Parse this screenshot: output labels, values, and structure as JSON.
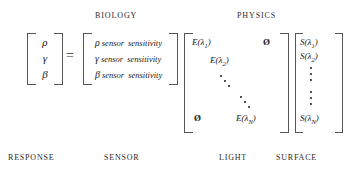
{
  "headings": {
    "biology": "BIOLOGY",
    "physics": "PHYSICS"
  },
  "equation": {
    "equals": "=",
    "response": {
      "label": "RESPONSE",
      "entries": [
        "ρ",
        "γ",
        "β"
      ]
    },
    "sensor": {
      "label": "SENSOR",
      "rows": [
        {
          "symbol": "ρ",
          "text": "sensor",
          "text2": "sensitivity"
        },
        {
          "symbol": "γ",
          "text": "sensor",
          "text2": "sensitivity"
        },
        {
          "symbol": "β",
          "text": "sensor",
          "text2": "sensitivity"
        }
      ]
    },
    "light": {
      "label": "LIGHT",
      "diagonal_first": "E(λ",
      "entries": [
        {
          "base": "E(λ",
          "sub": "1",
          "close": ")"
        },
        {
          "base": "E(λ",
          "sub": "2",
          "close": ")"
        },
        {
          "base": "E(λ",
          "sub": "N",
          "close": ")"
        }
      ],
      "zero_symbol": "Ø"
    },
    "surface": {
      "label": "SURFACE",
      "entries": [
        {
          "base": "S(λ",
          "sub": "1",
          "close": ")"
        },
        {
          "base": "S(λ",
          "sub": "2",
          "close": ")"
        },
        {
          "base": "S(λ",
          "sub": "N",
          "close": ")"
        }
      ]
    }
  },
  "colors": {
    "background": "#ffffff",
    "text": "#1a1a1a",
    "bracket": "#555555"
  }
}
